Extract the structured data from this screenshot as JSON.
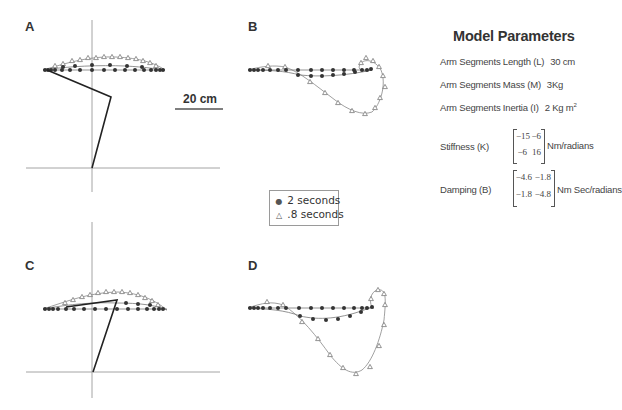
{
  "figure": {
    "panels": [
      {
        "id": "A",
        "label": "A"
      },
      {
        "id": "B",
        "label": "B"
      },
      {
        "id": "C",
        "label": "C"
      },
      {
        "id": "D",
        "label": "D"
      }
    ],
    "scale_bar": {
      "label": "20 cm"
    },
    "legend": {
      "items": [
        {
          "symbol": "●",
          "symbol_name": "filled-circle",
          "label": "2 seconds"
        },
        {
          "symbol": "△",
          "symbol_name": "open-triangle",
          "label": ".8 seconds"
        }
      ]
    },
    "colors": {
      "axis": "#9a9a9a",
      "arm": "#222222",
      "trajectory_line": "#777777",
      "marker_2s": "#333333",
      "marker_08s": "#888888",
      "text": "#333333"
    }
  },
  "model_parameters": {
    "title": "Model Parameters",
    "length": {
      "label": "Arm Segments Length (L)",
      "value": "30 cm"
    },
    "mass": {
      "label": "Arm Segments Mass (M)",
      "value": "3Kg"
    },
    "inertia": {
      "label": "Arm Segments Inertia (I)",
      "value": "2 Kg m",
      "superscript": "2"
    },
    "stiffness": {
      "label": "Stiffness (K)",
      "matrix": [
        [
          "−15",
          "−6"
        ],
        [
          "−6",
          "16"
        ]
      ],
      "unit": "Nm/radians"
    },
    "damping": {
      "label": "Damping (B)",
      "matrix": [
        [
          "−4.6",
          "−1.8"
        ],
        [
          "−1.8",
          "−4.8"
        ]
      ],
      "unit": "Nm Sec/radians"
    }
  }
}
